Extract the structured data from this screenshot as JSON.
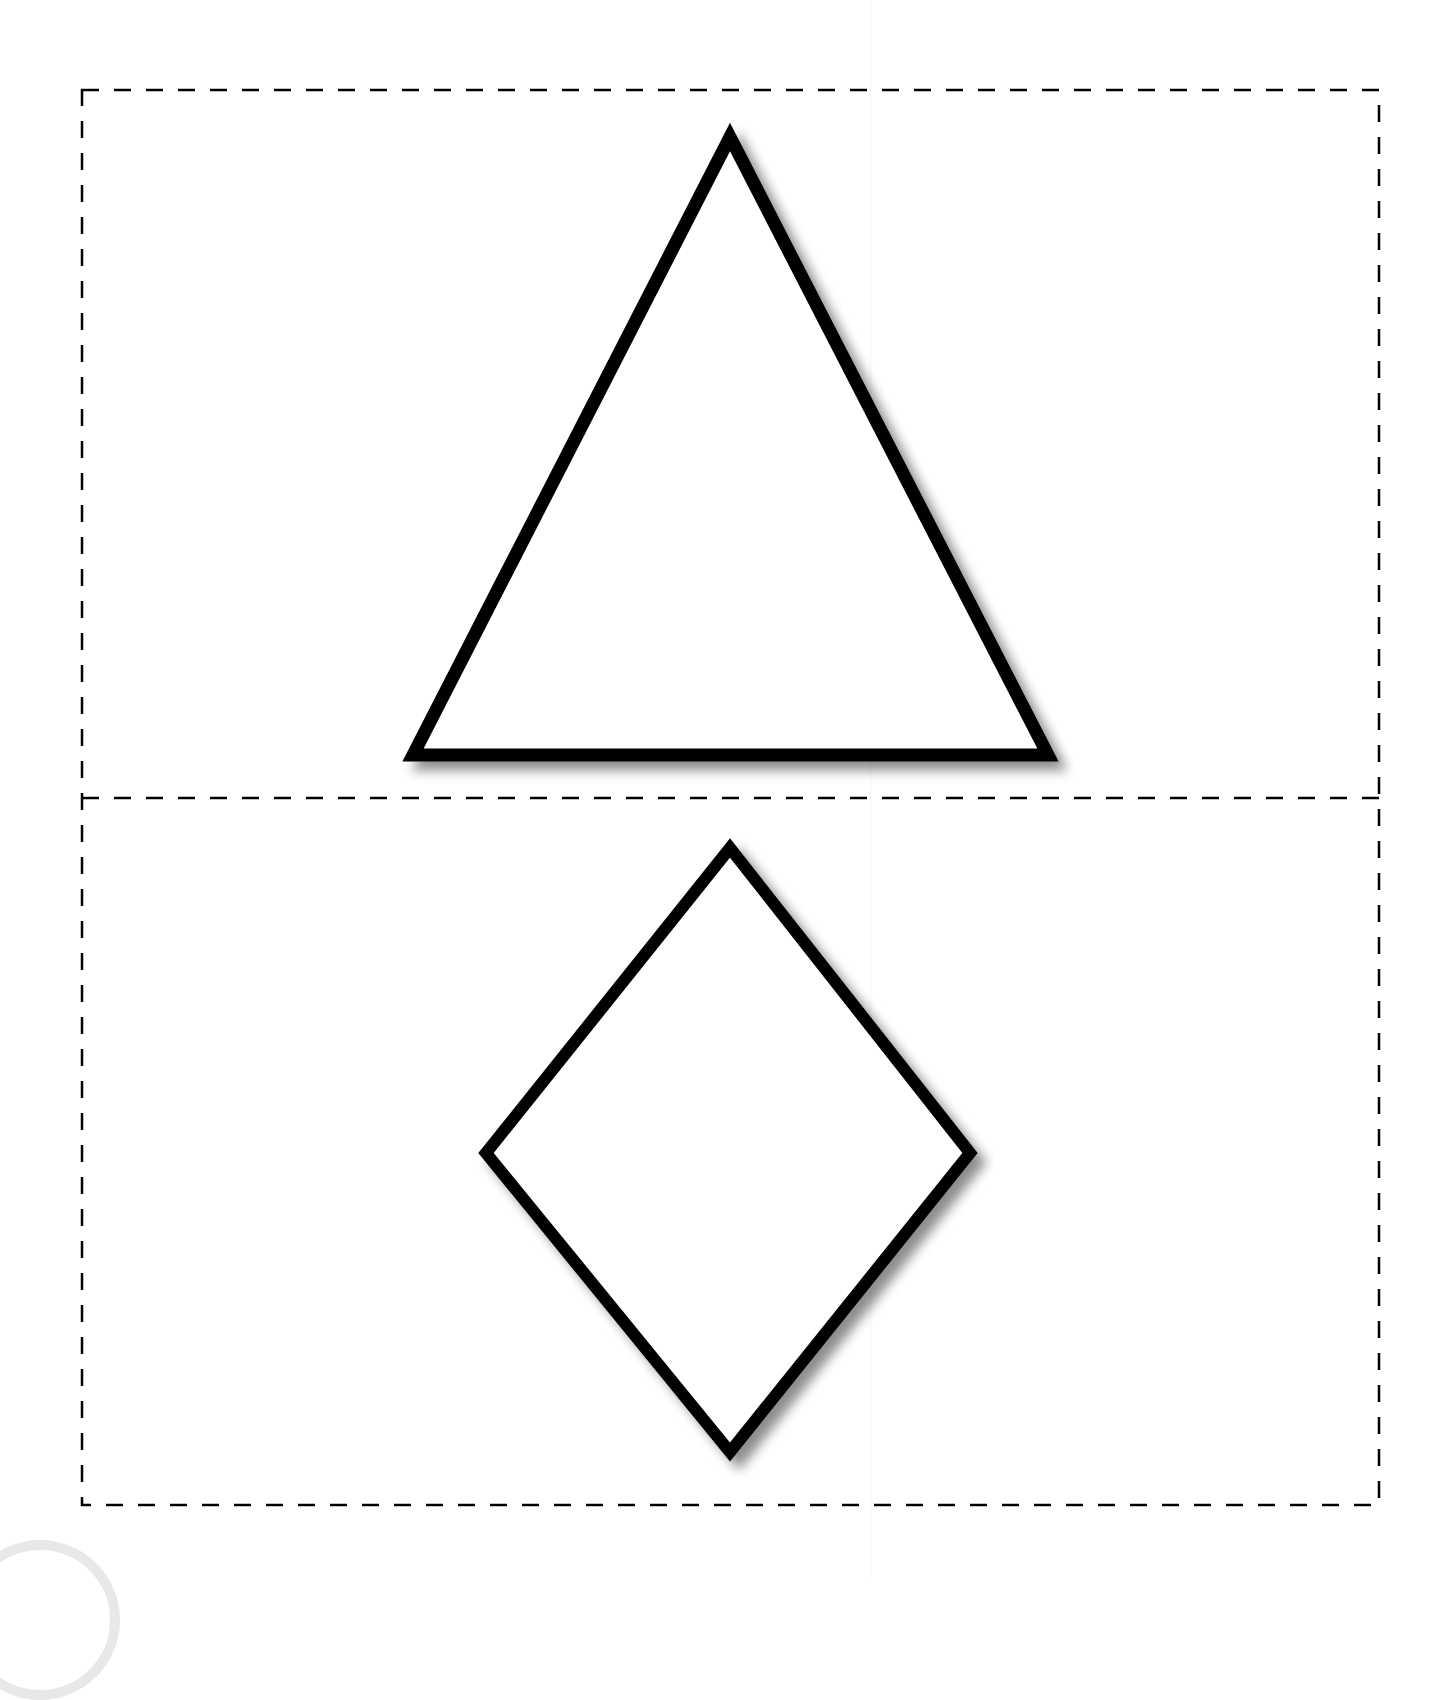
{
  "worksheet": {
    "panels": [
      {
        "id": "top",
        "shape": "triangle",
        "x": 82,
        "y": 90,
        "width": 1297,
        "height": 708
      },
      {
        "id": "bottom",
        "shape": "diamond",
        "x": 82,
        "y": 798,
        "width": 1297,
        "height": 707
      }
    ],
    "shapes": {
      "triangle": {
        "points": "730,137 413,755 1048,755"
      },
      "diamond": {
        "points": "730,848 970,1153 730,1452 486,1153"
      }
    },
    "colors": {
      "stroke": "#000000",
      "fill": "#ffffff",
      "cut_line": "#000000",
      "shadow": "#9a9a9a"
    },
    "cut_line_style": "dashed"
  }
}
